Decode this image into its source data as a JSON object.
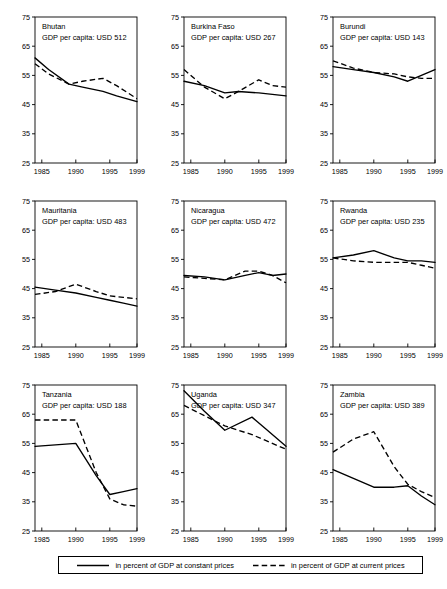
{
  "chart_data": {
    "type": "line",
    "title": "",
    "xlabel": "",
    "ylabel": "",
    "xlim": [
      1984,
      1999
    ],
    "ylim": [
      25,
      75
    ],
    "yticks": [
      25,
      35,
      45,
      55,
      65,
      75
    ],
    "xticks": [
      1985,
      1990,
      1995,
      1999
    ],
    "grid": false,
    "legend_position": "bottom",
    "legend": [
      {
        "label": "in percent of GDP at constant prices",
        "style": "solid"
      },
      {
        "label": "in percent of GDP at current prices",
        "style": "dashed"
      }
    ],
    "series_names": [
      "in percent of GDP at constant prices",
      "in percent of GDP at current prices"
    ],
    "panels": [
      {
        "country": "Bhutan",
        "subtitle": "GDP per capita: USD 512",
        "x": [
          1984,
          1986,
          1989,
          1991,
          1994,
          1996,
          1999
        ],
        "series": [
          {
            "name": "in percent of GDP at constant prices",
            "style": "solid",
            "values": [
              61.0,
              57.0,
              52.0,
              51.0,
              49.5,
              48.0,
              46.0
            ]
          },
          {
            "name": "in percent of GDP at current prices",
            "style": "dashed",
            "values": [
              59.0,
              55.5,
              52.0,
              53.0,
              54.0,
              51.5,
              47.0
            ]
          }
        ]
      },
      {
        "country": "Burkina Faso",
        "subtitle": "GDP per capita: USD 267",
        "x": [
          1984,
          1987,
          1990,
          1992,
          1995,
          1997,
          1999
        ],
        "series": [
          {
            "name": "in percent of GDP at constant prices",
            "style": "solid",
            "values": [
              53.0,
              51.5,
              49.0,
              49.5,
              49.0,
              48.5,
              48.0
            ]
          },
          {
            "name": "in percent of GDP at current prices",
            "style": "dashed",
            "values": [
              57.0,
              51.0,
              47.0,
              49.5,
              53.5,
              51.5,
              51.0
            ]
          }
        ]
      },
      {
        "country": "Burundi",
        "subtitle": "GDP per capita: USD 143",
        "x": [
          1984,
          1987,
          1990,
          1993,
          1995,
          1997,
          1999
        ],
        "series": [
          {
            "name": "in percent of GDP at constant prices",
            "style": "solid",
            "values": [
              58.0,
              57.0,
              56.0,
              54.5,
              53.0,
              55.0,
              57.0
            ]
          },
          {
            "name": "in percent of GDP at current prices",
            "style": "dashed",
            "values": [
              60.0,
              57.5,
              56.0,
              55.5,
              54.5,
              54.0,
              54.0
            ]
          }
        ]
      },
      {
        "country": "Mauritania",
        "subtitle": "GDP per capita: USD 483",
        "x": [
          1984,
          1987,
          1990,
          1993,
          1995,
          1997,
          1999
        ],
        "series": [
          {
            "name": "in percent of GDP at constant prices",
            "style": "solid",
            "values": [
              45.5,
              44.5,
              43.5,
              42.0,
              41.0,
              40.0,
              39.0
            ]
          },
          {
            "name": "in percent of GDP at current prices",
            "style": "dashed",
            "values": [
              43.0,
              44.0,
              46.5,
              44.0,
              42.5,
              42.0,
              41.5
            ]
          }
        ]
      },
      {
        "country": "Nicaragua",
        "subtitle": "GDP per capita: USD 472",
        "x": [
          1984,
          1987,
          1990,
          1993,
          1995,
          1997,
          1999
        ],
        "series": [
          {
            "name": "in percent of GDP at constant prices",
            "style": "solid",
            "values": [
              49.5,
              49.0,
              48.0,
              49.5,
              50.5,
              49.5,
              50.0
            ]
          },
          {
            "name": "in percent of GDP at current prices",
            "style": "dashed",
            "values": [
              49.0,
              48.5,
              48.0,
              51.0,
              51.0,
              49.5,
              47.0
            ]
          }
        ]
      },
      {
        "country": "Rwanda",
        "subtitle": "GDP per capita: USD 235",
        "x": [
          1984,
          1987,
          1990,
          1993,
          1995,
          1997,
          1999
        ],
        "series": [
          {
            "name": "in percent of GDP at constant prices",
            "style": "solid",
            "values": [
              55.5,
              56.5,
              58.0,
              55.5,
              54.5,
              54.5,
              54.0
            ]
          },
          {
            "name": "in percent of GDP at current prices",
            "style": "dashed",
            "values": [
              55.5,
              54.5,
              54.0,
              54.0,
              54.0,
              53.0,
              52.0
            ]
          }
        ]
      },
      {
        "country": "Tanzania",
        "subtitle": "GDP per capita: USD 188",
        "x": [
          1984,
          1987,
          1990,
          1993,
          1995,
          1997,
          1999
        ],
        "series": [
          {
            "name": "in percent of GDP at constant prices",
            "style": "solid",
            "values": [
              54.0,
              54.5,
              55.0,
              44.0,
              37.5,
              38.5,
              39.5
            ]
          },
          {
            "name": "in percent of GDP at current prices",
            "style": "dashed",
            "values": [
              63.0,
              63.0,
              63.0,
              45.0,
              36.0,
              34.0,
              33.5
            ]
          }
        ]
      },
      {
        "country": "Uganda",
        "subtitle": "GDP per capita: USD 347",
        "x": [
          1984,
          1987,
          1990,
          1994,
          1996,
          1999
        ],
        "series": [
          {
            "name": "in percent of GDP at constant prices",
            "style": "solid",
            "values": [
              73.0,
              66.0,
              59.5,
              64.0,
              60.0,
              54.0
            ]
          },
          {
            "name": "in percent of GDP at current prices",
            "style": "dashed",
            "values": [
              68.0,
              64.5,
              61.0,
              58.0,
              56.0,
              53.0
            ]
          }
        ]
      },
      {
        "country": "Zambia",
        "subtitle": "GDP per capita: USD 389",
        "x": [
          1984,
          1987,
          1990,
          1993,
          1995,
          1997,
          1999
        ],
        "series": [
          {
            "name": "in percent of GDP at constant prices",
            "style": "solid",
            "values": [
              46.0,
              43.0,
              40.0,
              40.0,
              40.5,
              37.0,
              34.0
            ]
          },
          {
            "name": "in percent of GDP at current prices",
            "style": "dashed",
            "values": [
              52.0,
              56.5,
              59.0,
              47.0,
              41.0,
              38.5,
              36.5
            ]
          }
        ]
      }
    ]
  }
}
